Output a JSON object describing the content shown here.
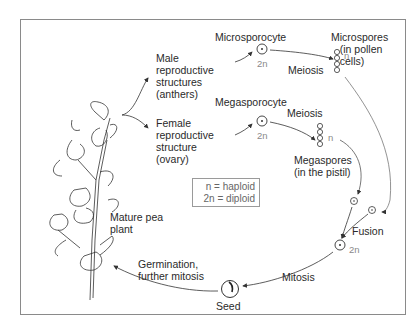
{
  "diagram": {
    "labels": {
      "male_structures": "Male\nreproductive\nstructures\n(anthers)",
      "female_structure": "Female\nreproductive\nstructure\n(ovary)",
      "microsporocyte": "Microsporocyte",
      "microspores": "Microspores\n   (in pollen\n   cells)",
      "meiosis_top": "Meiosis",
      "megasporocyte": "Megasporocyte",
      "meiosis_bottom": "Meiosis",
      "megaspores": "Megaspores\n(in the pistil)",
      "fusion": "Fusion",
      "mitosis": "Mitosis",
      "seed": "Seed",
      "germination": "Germination,\nfurther mitosis",
      "mature_plant": "Mature pea\nplant"
    },
    "ploidy": {
      "microsporocyte": "2n",
      "microspores": "n",
      "megasporocyte": "2n",
      "megaspores": "n",
      "zygote": "2n"
    },
    "legend": {
      "haploid": "n = haploid",
      "diploid": "2n = diploid"
    },
    "colors": {
      "line": "#333333",
      "frame": "#8a8a8a",
      "ploidy_text": "#8a8a8a"
    }
  }
}
